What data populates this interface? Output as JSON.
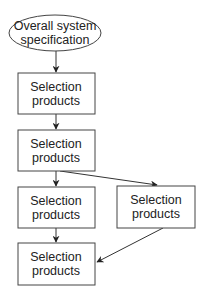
{
  "diagram": {
    "type": "flowchart",
    "colors": {
      "stroke": "#444444",
      "text": "#222222",
      "background": "#ffffff"
    },
    "nodes": [
      {
        "id": "start",
        "shape": "ellipse",
        "lines": [
          "Overall system",
          "specification"
        ]
      },
      {
        "id": "box1",
        "shape": "rect",
        "lines": [
          "Selection",
          "products"
        ]
      },
      {
        "id": "box2",
        "shape": "rect",
        "lines": [
          "Selection",
          "products"
        ]
      },
      {
        "id": "box3",
        "shape": "rect",
        "lines": [
          "Selection",
          "products"
        ]
      },
      {
        "id": "box_right",
        "shape": "rect",
        "lines": [
          "Selection",
          "products"
        ]
      },
      {
        "id": "box4",
        "shape": "rect",
        "lines": [
          "Selection",
          "products"
        ]
      }
    ],
    "edges": [
      {
        "from": "start",
        "to": "box1"
      },
      {
        "from": "box1",
        "to": "box2"
      },
      {
        "from": "box2",
        "to": "box3"
      },
      {
        "from": "box2",
        "to": "box_right"
      },
      {
        "from": "box3",
        "to": "box4"
      },
      {
        "from": "box_right",
        "to": "box4"
      }
    ]
  }
}
